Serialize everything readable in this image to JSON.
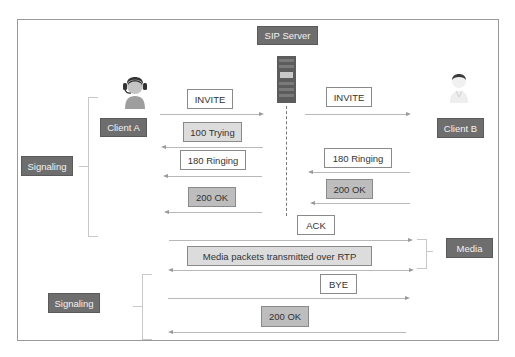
{
  "nodes": {
    "server": {
      "label": "SIP Server",
      "icon": "server-rack-icon"
    },
    "client_a": {
      "label": "Client A",
      "icon": "headset-user-icon"
    },
    "client_b": {
      "label": "Client B",
      "icon": "user-icon"
    }
  },
  "groups": {
    "signaling_1": "Signaling",
    "signaling_2": "Signaling",
    "media": "Media"
  },
  "messages": [
    {
      "id": "invite_a",
      "label": "INVITE",
      "direction": "right",
      "from": "Client A",
      "to": "SIP Server"
    },
    {
      "id": "invite_b",
      "label": "INVITE",
      "direction": "right",
      "from": "SIP Server",
      "to": "Client B"
    },
    {
      "id": "trying",
      "label": "100 Trying",
      "direction": "left",
      "from": "SIP Server",
      "to": "Client A"
    },
    {
      "id": "ringing_a",
      "label": "180 Ringing",
      "direction": "left",
      "from": "SIP Server",
      "to": "Client A"
    },
    {
      "id": "ringing_b",
      "label": "180 Ringing",
      "direction": "left",
      "from": "Client B",
      "to": "SIP Server"
    },
    {
      "id": "ok_b",
      "label": "200 OK",
      "direction": "left",
      "from": "Client B",
      "to": "SIP Server"
    },
    {
      "id": "ok_a",
      "label": "200 OK",
      "direction": "left",
      "from": "SIP Server",
      "to": "Client A"
    },
    {
      "id": "ack",
      "label": "ACK",
      "direction": "right",
      "from": "Client A",
      "to": "Client B"
    },
    {
      "id": "rtp",
      "label": "Media packets transmitted over RTP",
      "direction": "both",
      "from": "Client A",
      "to": "Client B"
    },
    {
      "id": "bye",
      "label": "BYE",
      "direction": "right",
      "from": "Client A",
      "to": "Client B"
    },
    {
      "id": "ok_bye",
      "label": "200 OK",
      "direction": "left",
      "from": "Client B",
      "to": "Client A"
    }
  ],
  "colors": {
    "dark_label": "#6e6e6e",
    "light_box": "#dcdcdc",
    "mid_box": "#bdbdbd",
    "arrow": "#b8b8b8",
    "frame": "#9a9a9a"
  }
}
